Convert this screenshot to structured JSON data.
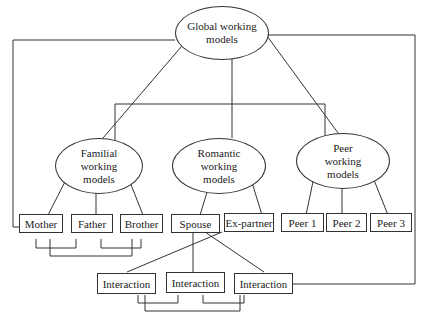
{
  "diagram": {
    "root": {
      "label": "Global working\nmodels"
    },
    "categories": [
      {
        "label": "Familial\nworking\nmodels"
      },
      {
        "label": "Romantic\nworking\nmodels"
      },
      {
        "label": "Peer\nworking\nmodels"
      }
    ],
    "familial_members": [
      {
        "label": "Mother"
      },
      {
        "label": "Father"
      },
      {
        "label": "Brother"
      }
    ],
    "romantic_members": [
      {
        "label": "Spouse"
      },
      {
        "label": "Ex-partner"
      }
    ],
    "peer_members": [
      {
        "label": "Peer 1"
      },
      {
        "label": "Peer 2"
      },
      {
        "label": "Peer 3"
      }
    ],
    "interactions": [
      {
        "label": "Interaction"
      },
      {
        "label": "Interaction"
      },
      {
        "label": "Interaction"
      }
    ]
  }
}
